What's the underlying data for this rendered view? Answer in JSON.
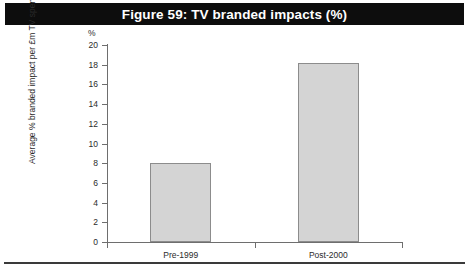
{
  "figure": {
    "title": "Figure 59: TV branded impacts (%)",
    "title_bar_color": "#0d0d0d",
    "title_text_color": "#ffffff"
  },
  "chart_data": {
    "type": "bar",
    "title": "Figure 59: TV branded impacts (%)",
    "categories": [
      "Pre-1999",
      "Post-2000"
    ],
    "values": [
      8.0,
      18.2
    ],
    "xlabel": "",
    "ylabel": "Average % branded impact per £m TV spend",
    "y_unit": "%",
    "ylim": [
      0,
      20
    ],
    "ytick_step": 2,
    "yticks": [
      "0",
      "2",
      "4",
      "6",
      "8",
      "10",
      "12",
      "14",
      "16",
      "18",
      "20"
    ],
    "grid": false,
    "legend": null,
    "bar_fill_color": "#d4d4d4",
    "bar_border_color": "#8c8c8c",
    "axis_color": "#6e6e6e"
  }
}
